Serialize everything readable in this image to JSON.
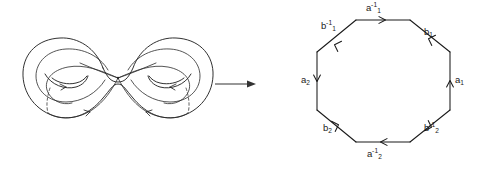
{
  "figure": {
    "background_color": "#ffffff",
    "ink_color": "#1a1a1a"
  },
  "surface": {
    "name": "genus-2-surface",
    "description": "double torus with two handles and four loops meeting at a basepoint",
    "handles": 2,
    "basepoint_label": ""
  },
  "map_arrow": {
    "name": "implies-arrow",
    "glyph": "→",
    "direction": "right"
  },
  "polygon": {
    "name": "fundamental-octagon",
    "sides": 8,
    "edge_word": "a1^-1 b1 a1 b1^-1 a2^-1 b2 a2 b2^-1",
    "edges": [
      {
        "id": "edge-a1-inverse",
        "base": "a",
        "sub": "1",
        "sup": "-1",
        "position": "top",
        "arrow_direction": "right"
      },
      {
        "id": "edge-b1",
        "base": "b",
        "sub": "1",
        "sup": "",
        "position": "top-right",
        "arrow_direction": "up-left"
      },
      {
        "id": "edge-a1",
        "base": "a",
        "sub": "1",
        "sup": "",
        "position": "right",
        "arrow_direction": "up"
      },
      {
        "id": "edge-b2-inverse",
        "base": "b",
        "sub": "2",
        "sup": "-1",
        "position": "bottom-right",
        "arrow_direction": "up-left"
      },
      {
        "id": "edge-a2-inverse",
        "base": "a",
        "sub": "2",
        "sup": "-1",
        "position": "bottom",
        "arrow_direction": "left"
      },
      {
        "id": "edge-b2",
        "base": "b",
        "sub": "2",
        "sup": "",
        "position": "bottom-left",
        "arrow_direction": "down-right"
      },
      {
        "id": "edge-a2",
        "base": "a",
        "sub": "2",
        "sup": "",
        "position": "left",
        "arrow_direction": "down"
      },
      {
        "id": "edge-b1-inverse",
        "base": "b",
        "sub": "1",
        "sup": "-1",
        "position": "top-left",
        "arrow_direction": "up-right"
      }
    ]
  }
}
